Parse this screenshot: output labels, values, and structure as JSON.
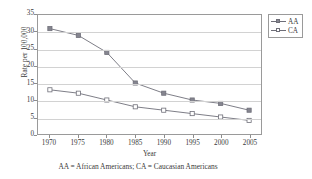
{
  "chart_data": {
    "type": "line",
    "title": "",
    "xlabel": "Year",
    "ylabel": "Rate per 100,000",
    "categories": [
      1970,
      1975,
      1980,
      1985,
      1990,
      1995,
      2000,
      2005
    ],
    "xticklabels": [
      "1970",
      "1975",
      "1980",
      "1985",
      "1990",
      "1995",
      "2000",
      "2005"
    ],
    "yticklabels": [
      "0",
      "5",
      "10",
      "15",
      "20",
      "25",
      "30",
      "35"
    ],
    "ylim": [
      0,
      35
    ],
    "ytick_step": 5,
    "xlim": [
      1967.5,
      2007.5
    ],
    "grid": "horizontal",
    "legend_position": "outside-right-top",
    "series": [
      {
        "name": "AA",
        "marker": "filled-square",
        "color": "#85858f",
        "values": [
          31,
          29,
          24,
          15,
          12,
          10,
          9,
          7
        ]
      },
      {
        "name": "CA",
        "marker": "open-square",
        "color": "#ffffff",
        "values": [
          13,
          12,
          10,
          8,
          7,
          6,
          5,
          4
        ]
      }
    ],
    "annotation": "AA = African Americans; CA = Caucasian Americans"
  },
  "legend": {
    "items": [
      {
        "label": "AA"
      },
      {
        "label": "CA"
      }
    ]
  },
  "colors": {
    "line": "#6e6e78",
    "marker_fill": "#85858f",
    "marker_open_fill": "#ffffff",
    "axis": "#9a9a9a",
    "grid": "#d2d2d2",
    "text": "#3a3a3a"
  }
}
